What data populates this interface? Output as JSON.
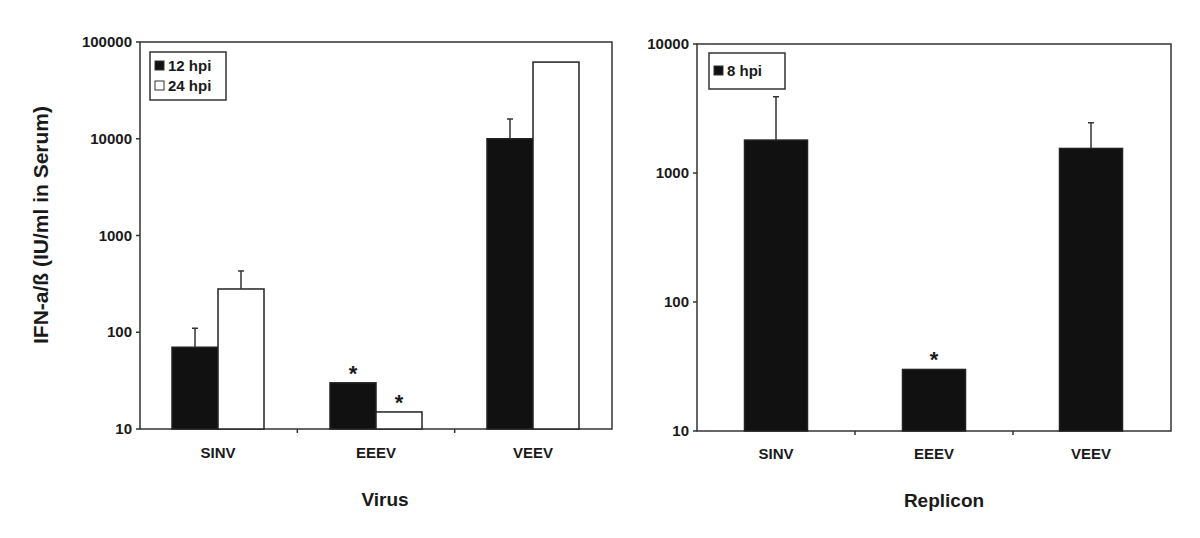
{
  "figure": {
    "y_axis_title": "IFN-a/ß (IU/ml in Serum)"
  },
  "chart_data": [
    {
      "type": "bar",
      "scale": "log",
      "title": "",
      "xlabel": "Virus",
      "ylabel": "IFN-a/ß (IU/ml in Serum)",
      "ylim": [
        10,
        100000
      ],
      "yticks": [
        10,
        100,
        1000,
        10000,
        100000
      ],
      "ytick_labels": [
        "10",
        "100",
        "1000",
        "10000",
        "100000"
      ],
      "categories": [
        "SINV",
        "EEEV",
        "VEEV"
      ],
      "series": [
        {
          "name": "12 hpi",
          "color": "#111111",
          "values": [
            70,
            30,
            10000
          ],
          "error_upper": [
            110,
            null,
            16000
          ],
          "significant": [
            false,
            true,
            false
          ]
        },
        {
          "name": "24 hpi",
          "color": "#ffffff",
          "values": [
            280,
            15,
            62000
          ],
          "error_upper": [
            430,
            null,
            null
          ],
          "significant": [
            false,
            true,
            false
          ]
        }
      ],
      "legend": {
        "position": "upper-left",
        "entries": [
          "12 hpi",
          "24 hpi"
        ]
      },
      "grid": false,
      "annotations": [
        "* significance marker above EEEV 12 hpi",
        "* significance marker above EEEV 24 hpi"
      ]
    },
    {
      "type": "bar",
      "scale": "log",
      "title": "",
      "xlabel": "Replicon",
      "ylabel": "",
      "ylim": [
        10,
        10000
      ],
      "yticks": [
        10,
        100,
        1000,
        10000
      ],
      "ytick_labels": [
        "10",
        "100",
        "1000",
        "10000"
      ],
      "categories": [
        "SINV",
        "EEEV",
        "VEEV"
      ],
      "series": [
        {
          "name": "8 hpi",
          "color": "#111111",
          "values": [
            1800,
            30,
            1550
          ],
          "error_upper": [
            3900,
            null,
            2450
          ],
          "significant": [
            false,
            true,
            false
          ]
        }
      ],
      "legend": {
        "position": "upper-left",
        "entries": [
          "8 hpi"
        ]
      },
      "grid": false,
      "annotations": [
        "* significance marker above EEEV 8 hpi"
      ]
    }
  ]
}
